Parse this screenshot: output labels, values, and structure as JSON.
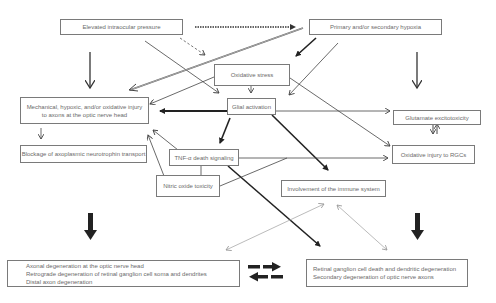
{
  "diagram": {
    "nodes": {
      "iop": {
        "label": "Elevated intraocular pressure"
      },
      "hypoxia": {
        "label": "Primary and/or secondary hypoxia"
      },
      "oxidative_stress": {
        "label": "Oxidative stress"
      },
      "glial": {
        "label": "Glial activation"
      },
      "mechanical": {
        "line1": "Mechanical, hypoxic, and/or oxidative injury",
        "line2": "to axons at the optic nerve head"
      },
      "blockage": {
        "label": "Blockage of axoplasmic neurotrophin transport"
      },
      "tnf": {
        "label": "TNF-α death signaling"
      },
      "nitric": {
        "label": "Nitric oxide toxicity"
      },
      "glutamate": {
        "label": "Glutamate excitotoxicity"
      },
      "oxidative_rgc": {
        "label": "Oxidative injury to RGCs"
      },
      "immune": {
        "label": "Involvement of the immune system"
      },
      "axonal": {
        "line1": "Axonal degeneration at the optic nerve head",
        "line2": "Retrograde degeneration of retinal ganglion cell soma and dendrites",
        "line3": "Distal axon degeneration"
      },
      "rgc_death": {
        "line1": "Retinal ganglion cell death and dendritic degeneration",
        "line2": "Secondary degeneration of optic nerve axons"
      }
    },
    "edges": [
      {
        "from": "iop",
        "to": "hypoxia",
        "style": "dotted-thick"
      },
      {
        "from": "iop",
        "to": "oxidative_stress",
        "style": "dashed"
      },
      {
        "from": "iop",
        "to": "glial",
        "style": "thin"
      },
      {
        "from": "iop",
        "to": "mechanical",
        "style": "medium-down"
      },
      {
        "from": "hypoxia",
        "to": "mechanical",
        "style": "double-line"
      },
      {
        "from": "hypoxia",
        "to": "oxidative_stress",
        "style": "thick"
      },
      {
        "from": "hypoxia",
        "to": "glial",
        "style": "thin"
      },
      {
        "from": "hypoxia",
        "to": "glutamate",
        "style": "medium-down"
      },
      {
        "from": "oxidative_stress",
        "to": "glial",
        "style": "thin"
      },
      {
        "from": "oxidative_stress",
        "to": "mechanical",
        "style": "thin"
      },
      {
        "from": "oxidative_stress",
        "to": "oxidative_rgc",
        "style": "thin"
      },
      {
        "from": "glial",
        "to": "mechanical",
        "style": "thick"
      },
      {
        "from": "glial",
        "to": "glutamate",
        "style": "thin"
      },
      {
        "from": "glial",
        "to": "tnf",
        "style": "thick"
      },
      {
        "from": "glial",
        "to": "immune",
        "style": "thick"
      },
      {
        "from": "mechanical",
        "to": "blockage",
        "style": "thin"
      },
      {
        "from": "tnf",
        "to": "mechanical",
        "style": "thin"
      },
      {
        "from": "tnf",
        "to": "oxidative_rgc",
        "style": "thin"
      },
      {
        "from": "tnf",
        "to": "rgc_death",
        "style": "thick"
      },
      {
        "from": "nitric",
        "to": "mechanical",
        "style": "thin"
      },
      {
        "from": "nitric",
        "to": "oxidative_rgc",
        "style": "thin"
      },
      {
        "from": "glutamate",
        "to": "oxidative_rgc",
        "style": "bidirectional"
      },
      {
        "from": "immune",
        "to": "axonal",
        "style": "light-bidirectional"
      },
      {
        "from": "immune",
        "to": "rgc_death",
        "style": "light-bidirectional"
      },
      {
        "from": "axonal",
        "to": "rgc_death",
        "style": "dashed-bidirectional-thick"
      }
    ],
    "colors": {
      "box_border": "#7a7a7a",
      "text": "#6a6a6a",
      "arrow_dark": "#2a2a2a",
      "arrow_mid": "#555555",
      "arrow_light": "#b0b0b0",
      "background": "#ffffff"
    }
  }
}
